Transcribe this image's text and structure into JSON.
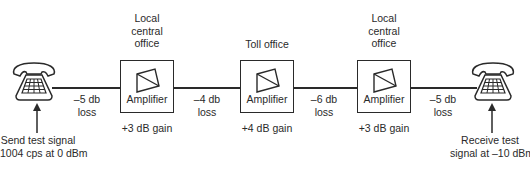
{
  "diagram": {
    "transmit_end": {
      "icon": "telephone-icon",
      "label_line1": "Send test signal",
      "label_line2": "1004 cps at 0 dBm"
    },
    "receive_end": {
      "icon": "telephone-icon",
      "label_line1": "Receive test",
      "label_line2": "signal at –10 dBm"
    },
    "offices": [
      {
        "title_lines": [
          "Local",
          "central",
          "office"
        ],
        "box_label": "Amplifier",
        "gain": "+3 dB gain"
      },
      {
        "title_lines": [
          "Toll office"
        ],
        "box_label": "Amplifier",
        "gain": "+4 dB gain"
      },
      {
        "title_lines": [
          "Local",
          "central",
          "office"
        ],
        "box_label": "Amplifier",
        "gain": "+3 dB gain"
      }
    ],
    "links": [
      {
        "value": "–5 db",
        "unit": "loss"
      },
      {
        "value": "–4 db",
        "unit": "loss"
      },
      {
        "value": "–6 db",
        "unit": "loss"
      },
      {
        "value": "–5 db",
        "unit": "loss"
      }
    ]
  }
}
